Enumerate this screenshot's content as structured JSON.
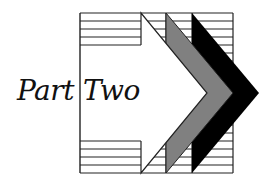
{
  "title": {
    "word1": "Part",
    "word2": "Two"
  },
  "graphic": {
    "description": "striped box with white arrow and gray and black chevrons",
    "colors": {
      "background": "#ffffff",
      "line": "#222222",
      "gray_chevron": "#808080",
      "black_chevron": "#000000",
      "white_arrow": "#ffffff"
    }
  }
}
